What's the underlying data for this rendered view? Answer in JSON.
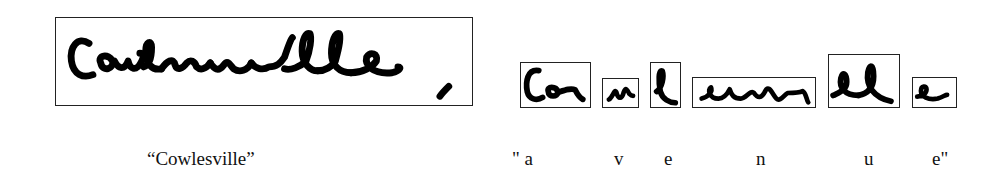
{
  "figure": {
    "word_image": {
      "description": "handwritten word image",
      "caption": "“Cowlesville”"
    },
    "segmentation": {
      "segments": [
        {
          "index": 1,
          "glyph": "Co"
        },
        {
          "index": 2,
          "glyph": "w"
        },
        {
          "index": 3,
          "glyph": "l"
        },
        {
          "index": 4,
          "glyph": "esvi"
        },
        {
          "index": 5,
          "glyph": "ll"
        },
        {
          "index": 6,
          "glyph": "e"
        }
      ],
      "recognized_labels": [
        "\" a",
        "v",
        "e",
        "n",
        "u",
        "e\""
      ],
      "recognized_word": "avenue"
    }
  }
}
